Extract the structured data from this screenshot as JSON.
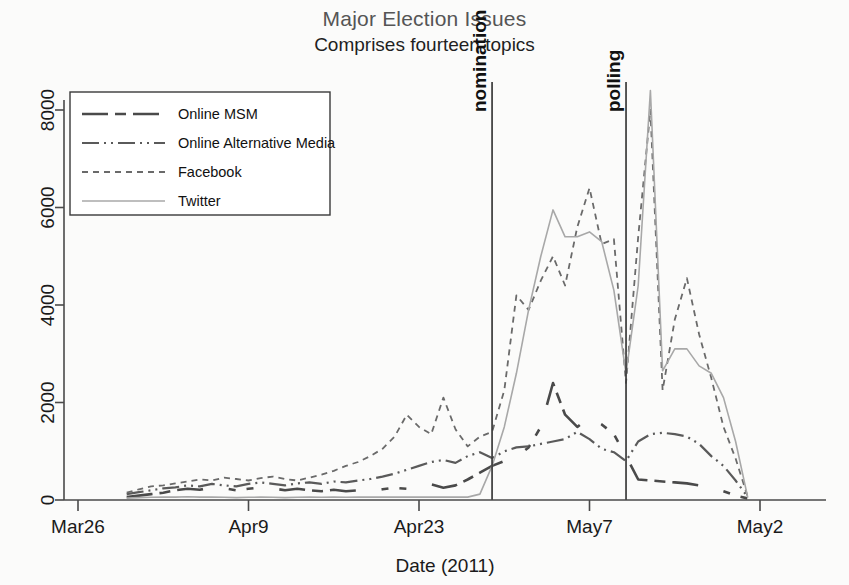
{
  "header": {
    "title": "Major Election Issues",
    "subtitle": "Comprises fourteen topics"
  },
  "axes": {
    "x_title": "Date (2011)",
    "x_ticks": [
      "Mar26",
      "Apr9",
      "Apr23",
      "May7",
      "May2"
    ],
    "y_ticks": [
      "0",
      "2000",
      "4000",
      "6000",
      "8000"
    ]
  },
  "annotations": [
    {
      "label": "nomination",
      "x_value": 34
    },
    {
      "label": "polling",
      "x_value": 45
    }
  ],
  "legend": {
    "items": [
      {
        "label": "Online MSM",
        "dash": "26,7,11,7,26",
        "color": "#4a4a4a",
        "width": 2.6
      },
      {
        "label": "Online Alternative Media",
        "dash": "17,5,2,5,2,5",
        "color": "#5a5a5a",
        "width": 2.2
      },
      {
        "label": "Facebook",
        "dash": "6,5",
        "color": "#6a6a6a",
        "width": 1.8
      },
      {
        "label": "Twitter",
        "dash": "none",
        "color": "#a8a8a8",
        "width": 1.6
      }
    ]
  },
  "chart_data": {
    "type": "line",
    "title": "Major Election Issues",
    "subtitle": "Comprises fourteen topics",
    "xlabel": "Date (2011)",
    "ylabel": "",
    "xlim": [
      0,
      56
    ],
    "ylim": [
      0,
      8800
    ],
    "grid": false,
    "legend_position": "top-left",
    "x_tick_values": [
      0,
      14,
      28,
      42,
      56
    ],
    "x_tick_labels": [
      "Mar26",
      "Apr9",
      "Apr23",
      "May7",
      "May2"
    ],
    "y_tick_values": [
      0,
      2000,
      4000,
      6000,
      8000
    ],
    "x_note": "x is days since Mar 26, 2011",
    "annotations": [
      {
        "label": "nomination",
        "x": 34
      },
      {
        "label": "polling",
        "x": 45
      }
    ],
    "series": [
      {
        "name": "Online MSM",
        "style": "dash",
        "x": [
          4,
          5,
          6,
          7,
          8,
          9,
          10,
          11,
          12,
          13,
          14,
          15,
          16,
          17,
          18,
          19,
          20,
          21,
          22,
          23,
          24,
          25,
          26,
          27,
          28,
          29,
          30,
          31,
          32,
          33,
          34,
          35,
          36,
          37,
          38,
          39,
          40,
          41,
          42,
          43,
          44,
          45,
          46,
          47,
          48,
          49,
          50,
          51,
          52,
          53,
          54,
          55
        ],
        "values": [
          60,
          90,
          120,
          150,
          200,
          230,
          210,
          260,
          240,
          200,
          230,
          260,
          240,
          200,
          230,
          200,
          180,
          210,
          180,
          200,
          170,
          220,
          250,
          230,
          290,
          320,
          250,
          300,
          420,
          560,
          700,
          800,
          880,
          1080,
          1500,
          2400,
          1750,
          1500,
          1700,
          1550,
          1350,
          900,
          420,
          400,
          380,
          360,
          340,
          300,
          260,
          180,
          90,
          30
        ]
      },
      {
        "name": "Online Alternative Media",
        "style": "dash-dot-dot",
        "x": [
          4,
          5,
          6,
          7,
          8,
          9,
          10,
          11,
          12,
          13,
          14,
          15,
          16,
          17,
          18,
          19,
          20,
          21,
          22,
          23,
          24,
          25,
          26,
          27,
          28,
          29,
          30,
          31,
          32,
          33,
          34,
          35,
          36,
          37,
          38,
          39,
          40,
          41,
          42,
          43,
          44,
          45,
          46,
          47,
          48,
          49,
          50,
          51,
          52,
          53,
          54,
          55
        ],
        "values": [
          120,
          160,
          200,
          240,
          260,
          300,
          280,
          330,
          300,
          280,
          330,
          360,
          330,
          300,
          340,
          360,
          330,
          380,
          360,
          400,
          430,
          480,
          540,
          620,
          700,
          780,
          820,
          760,
          900,
          980,
          860,
          1000,
          1080,
          1100,
          1150,
          1200,
          1250,
          1400,
          1250,
          1050,
          980,
          800,
          1200,
          1350,
          1380,
          1350,
          1300,
          1150,
          900,
          700,
          400,
          60
        ]
      },
      {
        "name": "Facebook",
        "style": "fine-dash",
        "x": [
          4,
          5,
          6,
          7,
          8,
          9,
          10,
          11,
          12,
          13,
          14,
          15,
          16,
          17,
          18,
          19,
          20,
          21,
          22,
          23,
          24,
          25,
          26,
          27,
          28,
          29,
          30,
          31,
          32,
          33,
          34,
          35,
          36,
          37,
          38,
          39,
          40,
          41,
          42,
          43,
          44,
          45,
          46,
          47,
          48,
          49,
          50,
          51,
          52,
          53,
          54,
          55
        ],
        "values": [
          150,
          220,
          280,
          300,
          340,
          380,
          420,
          400,
          460,
          430,
          400,
          450,
          480,
          430,
          400,
          460,
          520,
          600,
          700,
          780,
          900,
          1050,
          1300,
          1750,
          1500,
          1350,
          2100,
          1450,
          1100,
          1300,
          1400,
          2250,
          4200,
          3900,
          4500,
          5000,
          4400,
          5600,
          6400,
          5250,
          5350,
          2400,
          5400,
          8000,
          2250,
          3700,
          4550,
          3400,
          2500,
          1500,
          850,
          60
        ]
      },
      {
        "name": "Twitter",
        "style": "solid",
        "x": [
          4,
          5,
          6,
          7,
          8,
          9,
          10,
          11,
          12,
          13,
          14,
          15,
          16,
          17,
          18,
          19,
          20,
          21,
          22,
          23,
          24,
          25,
          26,
          27,
          28,
          29,
          30,
          31,
          32,
          33,
          34,
          35,
          36,
          37,
          38,
          39,
          40,
          41,
          42,
          43,
          44,
          45,
          46,
          47,
          48,
          49,
          50,
          51,
          52,
          53,
          54,
          55
        ],
        "values": [
          40,
          50,
          55,
          60,
          60,
          65,
          60,
          60,
          55,
          50,
          55,
          60,
          55,
          50,
          55,
          60,
          55,
          60,
          55,
          60,
          60,
          60,
          60,
          60,
          60,
          60,
          60,
          60,
          60,
          120,
          700,
          1500,
          2600,
          3900,
          5000,
          5950,
          5400,
          5400,
          5500,
          5300,
          4300,
          2600,
          4400,
          8400,
          2650,
          3100,
          3100,
          2750,
          2600,
          2100,
          1200,
          50
        ]
      }
    ]
  }
}
